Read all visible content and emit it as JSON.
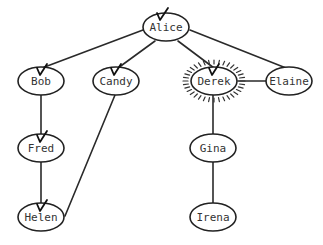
{
  "diagram": {
    "type": "tree",
    "colors": {
      "stroke": "#222222",
      "text": "#333333",
      "background": "#ffffff"
    },
    "nodes": [
      {
        "id": "alice",
        "label": "Alice",
        "x": 166,
        "y": 27,
        "checked": true,
        "highlighted": false
      },
      {
        "id": "bob",
        "label": "Bob",
        "x": 40,
        "y": 81,
        "checked": true,
        "highlighted": false
      },
      {
        "id": "candy",
        "label": "Candy",
        "x": 116,
        "y": 81,
        "checked": true,
        "highlighted": false
      },
      {
        "id": "derek",
        "label": "Derek",
        "x": 214,
        "y": 81,
        "checked": true,
        "highlighted": true
      },
      {
        "id": "elaine",
        "label": "Elaine",
        "x": 289,
        "y": 81,
        "checked": false,
        "highlighted": false
      },
      {
        "id": "fred",
        "label": "Fred",
        "x": 41,
        "y": 148,
        "checked": true,
        "highlighted": false
      },
      {
        "id": "gina",
        "label": "Gina",
        "x": 213,
        "y": 148,
        "checked": false,
        "highlighted": false
      },
      {
        "id": "helen",
        "label": "Helen",
        "x": 41,
        "y": 217,
        "checked": true,
        "highlighted": false
      },
      {
        "id": "irena",
        "label": "Irena",
        "x": 213,
        "y": 217,
        "checked": false,
        "highlighted": false
      }
    ],
    "edges": [
      {
        "from": "alice",
        "to": "bob"
      },
      {
        "from": "alice",
        "to": "candy"
      },
      {
        "from": "alice",
        "to": "derek"
      },
      {
        "from": "alice",
        "to": "elaine"
      },
      {
        "from": "elaine",
        "to": "derek"
      },
      {
        "from": "bob",
        "to": "fred"
      },
      {
        "from": "fred",
        "to": "helen"
      },
      {
        "from": "candy",
        "to": "helen"
      },
      {
        "from": "derek",
        "to": "gina"
      },
      {
        "from": "gina",
        "to": "irena"
      }
    ]
  }
}
